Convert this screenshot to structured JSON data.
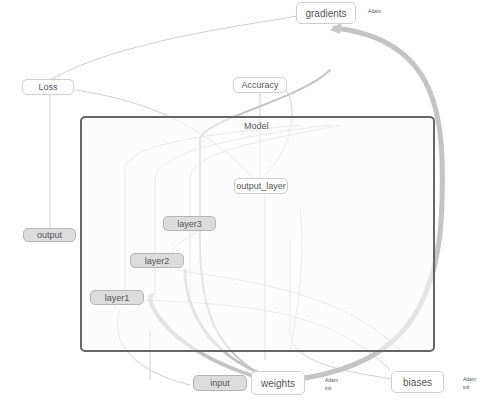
{
  "graph": {
    "group": {
      "label": "Model"
    },
    "nodes": {
      "gradients": "gradients",
      "loss": "Loss",
      "accuracy": "Accuracy",
      "output_layer": "output_layer",
      "output": "output",
      "layer3": "layer3",
      "layer2": "layer2",
      "layer1": "layer1",
      "input": "input",
      "weights": "weights",
      "biases": "biases"
    },
    "aux_labels": {
      "gradients_adam": "Adam",
      "weights_adam": "Adam",
      "weights_init": "init",
      "biases_adam": "Adam",
      "biases_init": "init"
    },
    "colors": {
      "op_node": "#dcdcdc",
      "plain_node": "#ffffff",
      "group_border": "#666666",
      "edge": "#c8c8c8",
      "thick_edge": "#bdbdbd"
    }
  }
}
